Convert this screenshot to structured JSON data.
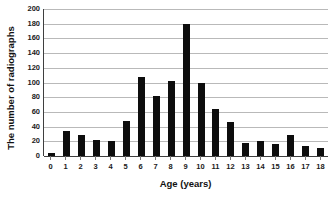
{
  "chart_data": {
    "type": "bar",
    "title": "",
    "xlabel": "Age (years)",
    "ylabel": "The number of radiographs",
    "categories": [
      "0",
      "1",
      "2",
      "3",
      "4",
      "5",
      "6",
      "7",
      "8",
      "9",
      "10",
      "11",
      "12",
      "13",
      "14",
      "15",
      "16",
      "17",
      "18"
    ],
    "values": [
      4,
      34,
      29,
      22,
      20,
      47,
      108,
      81,
      102,
      180,
      100,
      64,
      46,
      18,
      20,
      16,
      28,
      13,
      11
    ],
    "ylim": [
      0,
      200
    ],
    "yticks": [
      0,
      20,
      40,
      60,
      80,
      100,
      120,
      140,
      160,
      180,
      200
    ],
    "ytick_labels": [
      "0",
      "20",
      "40",
      "60",
      "80",
      "100",
      "120",
      "140",
      "160",
      "180",
      "200"
    ],
    "grid": true,
    "legend": false,
    "bar_color": "#0d0d0d",
    "gridline_color": "#b9b9b9",
    "axis_color": "#3f3f3f"
  }
}
